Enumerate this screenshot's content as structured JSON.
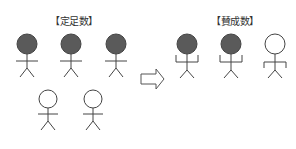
{
  "left_group": {
    "title": "【定足数】",
    "figures": [
      {
        "state": "filled",
        "pose": "arms-horizontal"
      },
      {
        "state": "filled",
        "pose": "arms-horizontal"
      },
      {
        "state": "filled",
        "pose": "arms-horizontal"
      },
      {
        "state": "empty",
        "pose": "arms-horizontal"
      },
      {
        "state": "empty",
        "pose": "arms-horizontal"
      }
    ]
  },
  "arrow": {
    "icon": "right-arrow-icon"
  },
  "right_group": {
    "title": "【賛成数】",
    "figures": [
      {
        "state": "filled",
        "pose": "arms-raised"
      },
      {
        "state": "filled",
        "pose": "arms-raised"
      },
      {
        "state": "empty",
        "pose": "arms-lowered"
      }
    ]
  },
  "colors": {
    "filled_head": "#5a5a5a",
    "stroke": "#444444",
    "empty_head": "#ffffff"
  }
}
